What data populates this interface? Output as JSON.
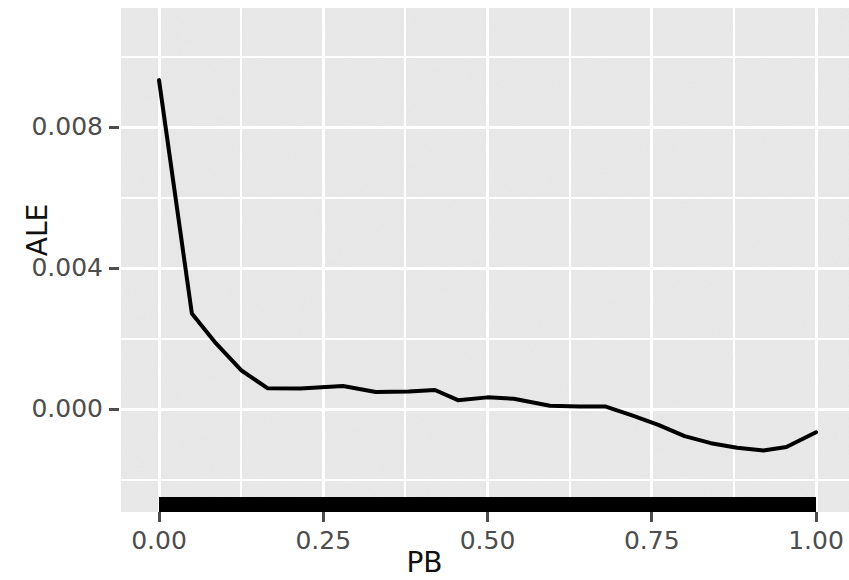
{
  "chart_data": {
    "type": "line",
    "title": "",
    "subtitle": "",
    "xlabel": "PB",
    "ylabel": "ALE",
    "xlim": [
      0.0,
      1.0
    ],
    "ylim": [
      -0.0017,
      0.0099
    ],
    "grid": true,
    "legend": null,
    "x_ticks": [
      0.0,
      0.25,
      0.5,
      0.75,
      1.0
    ],
    "x_tick_labels": [
      "0.00",
      "0.25",
      "0.50",
      "0.75",
      "1.00"
    ],
    "y_ticks": [
      0.0,
      0.004,
      0.008
    ],
    "y_tick_labels": [
      "0.000",
      "0.004",
      "0.008"
    ],
    "series": [
      {
        "name": "ALE",
        "color": "#000000",
        "x": [
          0.0,
          0.05,
          0.085,
          0.125,
          0.165,
          0.215,
          0.28,
          0.33,
          0.38,
          0.42,
          0.455,
          0.5,
          0.54,
          0.595,
          0.64,
          0.68,
          0.72,
          0.76,
          0.8,
          0.84,
          0.88,
          0.92,
          0.955,
          1.0
        ],
        "y": [
          0.00933,
          0.00271,
          0.0019,
          0.0011,
          0.00059,
          0.00058,
          0.00065,
          0.00048,
          0.0005,
          0.00054,
          0.00025,
          0.00033,
          0.00029,
          9e-05,
          7e-05,
          7e-05,
          -0.00018,
          -0.00045,
          -0.00077,
          -0.00097,
          -0.0011,
          -0.00118,
          -0.00108,
          -0.00066
        ]
      }
    ],
    "rug": {
      "name": "data-distribution-rug",
      "color": "#000000",
      "x_start": 0.0,
      "x_end": 1.0
    },
    "panel_background": "#e9e9e9",
    "gridline_color": "#ffffff",
    "minor_y_ticks": [
      -0.002,
      0.002,
      0.006,
      0.01
    ],
    "minor_x_ticks": [
      0.125,
      0.375,
      0.625,
      0.875
    ]
  }
}
